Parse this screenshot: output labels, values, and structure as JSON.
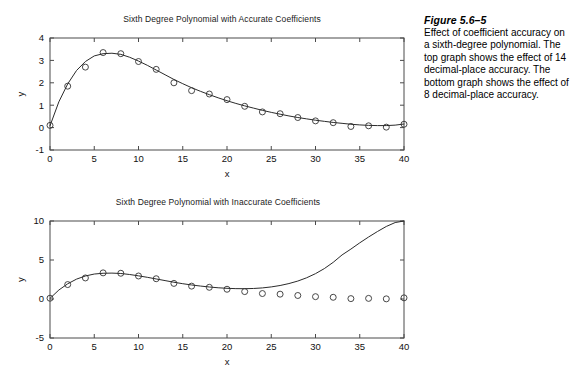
{
  "figure": {
    "caption_title": "Figure 5.6–5",
    "caption_body": "Effect of coefficient accuracy on a sixth-degree polynomial. The top graph shows the effect of 14 decimal-place accuracy. The bottom graph shows the effect of 8 decimal-place accuracy."
  },
  "chart_data": [
    {
      "id": "top",
      "type": "line",
      "title": "Sixth Degree Polynomial with Accurate Coefficients",
      "xlabel": "x",
      "ylabel": "y",
      "xlim": [
        0,
        40
      ],
      "ylim": [
        -1,
        4
      ],
      "xticks": [
        0,
        5,
        10,
        15,
        20,
        25,
        30,
        35,
        40
      ],
      "yticks": [
        -1,
        0,
        1,
        2,
        3,
        4
      ],
      "xtick_labels": [
        "0",
        "5",
        "10",
        "15",
        "20",
        "25",
        "30",
        "35",
        "40"
      ],
      "ytick_labels": [
        "-1",
        "0",
        "1",
        "2",
        "3",
        "4"
      ],
      "grid": false,
      "legend": "none",
      "series": [
        {
          "name": "data",
          "marker": "circle",
          "x": [
            0,
            2,
            4,
            6,
            8,
            10,
            12,
            14,
            16,
            18,
            20,
            22,
            24,
            26,
            28,
            30,
            32,
            34,
            36,
            38,
            40
          ],
          "values": [
            0.1,
            1.85,
            2.7,
            3.35,
            3.3,
            2.95,
            2.6,
            2.0,
            1.65,
            1.5,
            1.25,
            0.95,
            0.7,
            0.62,
            0.45,
            0.3,
            0.22,
            0.05,
            0.08,
            0.02,
            0.15
          ]
        },
        {
          "name": "fit",
          "marker": "none",
          "x": [
            0,
            1,
            2,
            3,
            4,
            5,
            6,
            7,
            8,
            9,
            10,
            11,
            12,
            13,
            14,
            15,
            16,
            17,
            18,
            19,
            20,
            21,
            22,
            23,
            24,
            25,
            26,
            27,
            28,
            29,
            30,
            31,
            32,
            33,
            34,
            35,
            36,
            37,
            38,
            39,
            40
          ],
          "values": [
            0.08,
            1.15,
            1.95,
            2.55,
            2.95,
            3.2,
            3.3,
            3.32,
            3.27,
            3.14,
            2.97,
            2.78,
            2.57,
            2.36,
            2.15,
            1.96,
            1.78,
            1.62,
            1.47,
            1.33,
            1.2,
            1.08,
            0.97,
            0.87,
            0.77,
            0.68,
            0.6,
            0.52,
            0.45,
            0.39,
            0.33,
            0.28,
            0.23,
            0.19,
            0.15,
            0.12,
            0.1,
            0.09,
            0.09,
            0.11,
            0.16
          ]
        }
      ]
    },
    {
      "id": "bottom",
      "type": "line",
      "title": "Sixth Degree Polynomial with Inaccurate Coefficients",
      "xlabel": "x",
      "ylabel": "y",
      "xlim": [
        0,
        40
      ],
      "ylim": [
        -5,
        10
      ],
      "xticks": [
        0,
        5,
        10,
        15,
        20,
        25,
        30,
        35,
        40
      ],
      "yticks": [
        -5,
        0,
        5,
        10
      ],
      "xtick_labels": [
        "0",
        "5",
        "10",
        "15",
        "20",
        "25",
        "30",
        "35",
        "40"
      ],
      "ytick_labels": [
        "-5",
        "0",
        "5",
        "10"
      ],
      "grid": false,
      "legend": "none",
      "series": [
        {
          "name": "data",
          "marker": "circle",
          "x": [
            0,
            2,
            4,
            6,
            8,
            10,
            12,
            14,
            16,
            18,
            20,
            22,
            24,
            26,
            28,
            30,
            32,
            34,
            36,
            38,
            40
          ],
          "values": [
            0.1,
            1.85,
            2.7,
            3.35,
            3.3,
            2.95,
            2.6,
            2.0,
            1.65,
            1.5,
            1.25,
            0.95,
            0.7,
            0.62,
            0.45,
            0.3,
            0.22,
            0.05,
            0.08,
            0.02,
            0.15
          ]
        },
        {
          "name": "fit",
          "marker": "none",
          "x": [
            0,
            1,
            2,
            3,
            4,
            5,
            6,
            7,
            8,
            9,
            10,
            11,
            12,
            13,
            14,
            15,
            16,
            17,
            18,
            19,
            20,
            21,
            22,
            23,
            24,
            25,
            26,
            27,
            28,
            29,
            30,
            31,
            32,
            33,
            34,
            35,
            36,
            37,
            38,
            39,
            40
          ],
          "values": [
            0.08,
            1.15,
            1.95,
            2.55,
            2.95,
            3.2,
            3.3,
            3.32,
            3.27,
            3.14,
            2.97,
            2.78,
            2.57,
            2.36,
            2.15,
            1.96,
            1.8,
            1.66,
            1.54,
            1.44,
            1.37,
            1.33,
            1.32,
            1.35,
            1.42,
            1.55,
            1.73,
            1.98,
            2.3,
            2.72,
            3.25,
            3.9,
            4.7,
            5.65,
            6.4,
            7.2,
            7.95,
            8.65,
            9.3,
            9.8,
            10.0
          ]
        }
      ]
    }
  ]
}
